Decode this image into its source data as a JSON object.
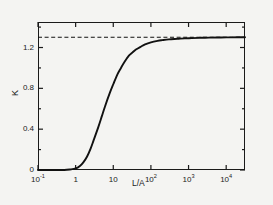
{
  "chart_data": {
    "type": "line",
    "title": "",
    "xlabel": "L/A",
    "ylabel": "K",
    "xscale": "log",
    "xlim": [
      0.1,
      31623
    ],
    "ylim": [
      0,
      1.45
    ],
    "grid": false,
    "legend": null,
    "x_ticks": [
      {
        "value": 0.1,
        "label": "10",
        "exponent": "-1"
      },
      {
        "value": 1,
        "label": "1",
        "exponent": ""
      },
      {
        "value": 10,
        "label": "10",
        "exponent": ""
      },
      {
        "value": 100,
        "label": "10",
        "exponent": "2"
      },
      {
        "value": 1000,
        "label": "10",
        "exponent": "3"
      },
      {
        "value": 10000,
        "label": "10",
        "exponent": "4"
      }
    ],
    "y_ticks": [
      {
        "value": 0,
        "label": "0"
      },
      {
        "value": 0.2,
        "label": ""
      },
      {
        "value": 0.4,
        "label": "0.4"
      },
      {
        "value": 0.6,
        "label": ""
      },
      {
        "value": 0.8,
        "label": "0.8"
      },
      {
        "value": 1.0,
        "label": ""
      },
      {
        "value": 1.2,
        "label": "1.2"
      },
      {
        "value": 1.4,
        "label": ""
      }
    ],
    "series": [
      {
        "name": "K curve",
        "style": "solid",
        "color": "#111111",
        "x": [
          0.1,
          0.2,
          0.3,
          0.5,
          0.7,
          1.0,
          1.3,
          1.6,
          2.0,
          2.5,
          3.0,
          4.0,
          5.0,
          6.0,
          8.0,
          10.0,
          13.0,
          16.0,
          20.0,
          26.0,
          32.0,
          40.0,
          55.0,
          70.0,
          100.0,
          150.0,
          200.0,
          300.0,
          500.0,
          800.0,
          1200.0,
          2000.0,
          3500.0,
          6000.0,
          10000.0,
          20000.0,
          31623.0
        ],
        "y": [
          0.0,
          0.0,
          0.0,
          0.0,
          0.005,
          0.015,
          0.04,
          0.075,
          0.13,
          0.21,
          0.29,
          0.42,
          0.53,
          0.62,
          0.75,
          0.84,
          0.94,
          1.0,
          1.06,
          1.12,
          1.15,
          1.18,
          1.21,
          1.23,
          1.25,
          1.265,
          1.272,
          1.28,
          1.285,
          1.29,
          1.292,
          1.295,
          1.297,
          1.298,
          1.299,
          1.3,
          1.3
        ]
      },
      {
        "name": "asymptote",
        "style": "dashed",
        "color": "#111111",
        "constant_y": 1.3
      }
    ]
  }
}
